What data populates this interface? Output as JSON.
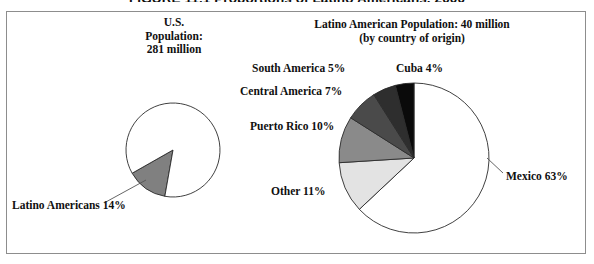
{
  "figure": {
    "caption": "FIGURE 11.1 Proportions of Latino Americans, 2000",
    "border_color": "#8d8d8d"
  },
  "us_pie": {
    "heading_line1": "U.S.",
    "heading_line2": "Population:",
    "heading_line3": "281 million",
    "callout_label": "Latino Americans 14%"
  },
  "latino_pie": {
    "heading_line1": "Latino American Population: 40 million",
    "heading_line2": "(by country of origin)",
    "labels": {
      "mexico": "Mexico 63%",
      "other": "Other 11%",
      "puerto_rico": "Puerto Rico 10%",
      "central_america": "Central America 7%",
      "south_america": "South America 5%",
      "cuba": "Cuba 4%"
    }
  },
  "chart_data": [
    {
      "type": "pie",
      "title": "U.S. Population: 281 million",
      "categories": [
        "Latino Americans",
        "Other U.S. Population"
      ],
      "values": [
        14,
        86
      ],
      "value_labels": [
        "14%",
        "86%"
      ],
      "colors": [
        "#808080",
        "#ffffff"
      ],
      "units": "percent",
      "total_population": "281 million",
      "legend": "none",
      "annotations": [
        "Latino Americans 14%"
      ]
    },
    {
      "type": "pie",
      "title": "Latino American Population: 40 million (by country of origin)",
      "categories": [
        "Mexico",
        "Other",
        "Puerto Rico",
        "Central America",
        "South America",
        "Cuba"
      ],
      "values": [
        63,
        11,
        10,
        7,
        5,
        4
      ],
      "value_labels": [
        "63%",
        "11%",
        "10%",
        "7%",
        "5%",
        "4%"
      ],
      "colors": [
        "#ffffff",
        "#e3e3e3",
        "#8a8a8a",
        "#4a4a4a",
        "#2e2e2e",
        "#0a0a0a"
      ],
      "units": "percent",
      "total_population": "40 million",
      "legend": "none",
      "annotations": [
        "Mexico 63%",
        "Other 11%",
        "Puerto Rico 10%",
        "Central America 7%",
        "South America 5%",
        "Cuba 4%"
      ]
    }
  ]
}
